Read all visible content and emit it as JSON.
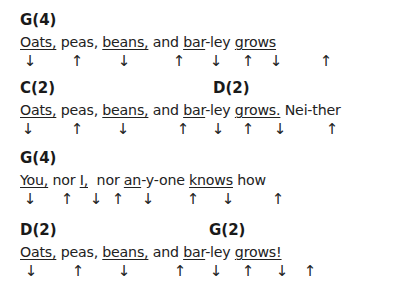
{
  "blocks": [
    {
      "top": 12,
      "chords": [
        {
          "label": "G(4)",
          "x": 20
        }
      ],
      "lyrics": [
        {
          "text": "Oats,",
          "u": true
        },
        {
          "text": " peas, ",
          "u": false
        },
        {
          "text": "beans,",
          "u": true
        },
        {
          "text": " and ",
          "u": false
        },
        {
          "text": "bar",
          "u": true
        },
        {
          "text": "-ley ",
          "u": false
        },
        {
          "text": "grows",
          "u": true
        }
      ],
      "strums": [
        {
          "dir": "down",
          "glyph": "↓",
          "x": 30
        },
        {
          "dir": "up",
          "glyph": "↑",
          "x": 77
        },
        {
          "dir": "down",
          "glyph": "↓",
          "x": 124
        },
        {
          "dir": "up",
          "glyph": "↑",
          "x": 179
        },
        {
          "dir": "down",
          "glyph": "↓",
          "x": 216
        },
        {
          "dir": "up",
          "glyph": "↑",
          "x": 248
        },
        {
          "dir": "down",
          "glyph": "↓",
          "x": 276
        },
        {
          "dir": "up",
          "glyph": "↑",
          "x": 326
        }
      ]
    },
    {
      "top": 80,
      "chords": [
        {
          "label": "C(2)",
          "x": 20
        },
        {
          "label": "D(2)",
          "x": 213
        }
      ],
      "lyrics": [
        {
          "text": "Oats,",
          "u": true
        },
        {
          "text": " peas, ",
          "u": false
        },
        {
          "text": "beans,",
          "u": true
        },
        {
          "text": " and ",
          "u": false
        },
        {
          "text": "bar",
          "u": true
        },
        {
          "text": "-ley ",
          "u": false
        },
        {
          "text": "grows.",
          "u": true
        },
        {
          "text": " Nei-ther",
          "u": false
        }
      ],
      "strums": [
        {
          "dir": "down",
          "glyph": "↓",
          "x": 28
        },
        {
          "dir": "up",
          "glyph": "↑",
          "x": 77
        },
        {
          "dir": "down",
          "glyph": "↓",
          "x": 123
        },
        {
          "dir": "up",
          "glyph": "↑",
          "x": 183
        },
        {
          "dir": "down",
          "glyph": "↓",
          "x": 218
        },
        {
          "dir": "up",
          "glyph": "↑",
          "x": 248
        },
        {
          "dir": "down",
          "glyph": "↓",
          "x": 280
        },
        {
          "dir": "up",
          "glyph": "↑",
          "x": 332
        }
      ]
    },
    {
      "top": 150,
      "chords": [
        {
          "label": "G(4)",
          "x": 20
        }
      ],
      "lyrics": [
        {
          "text": "You,",
          "u": true
        },
        {
          "text": " nor ",
          "u": false
        },
        {
          "text": "I,",
          "u": true
        },
        {
          "text": "  nor ",
          "u": false
        },
        {
          "text": "an",
          "u": true
        },
        {
          "text": "-y-one ",
          "u": false
        },
        {
          "text": "knows",
          "u": true
        },
        {
          "text": " how",
          "u": false
        }
      ],
      "strums": [
        {
          "dir": "down",
          "glyph": "↓",
          "x": 30
        },
        {
          "dir": "up",
          "glyph": "↑",
          "x": 67
        },
        {
          "dir": "down",
          "glyph": "↓",
          "x": 96
        },
        {
          "dir": "up",
          "glyph": "↑",
          "x": 118
        },
        {
          "dir": "down",
          "glyph": "↓",
          "x": 148
        },
        {
          "dir": "up",
          "glyph": "↑",
          "x": 193
        },
        {
          "dir": "down",
          "glyph": "↓",
          "x": 228
        },
        {
          "dir": "up",
          "glyph": "↑",
          "x": 278
        }
      ]
    },
    {
      "top": 222,
      "chords": [
        {
          "label": "D(2)",
          "x": 20
        },
        {
          "label": "G(2)",
          "x": 209
        }
      ],
      "lyrics": [
        {
          "text": "Oats,",
          "u": true
        },
        {
          "text": " peas, ",
          "u": false
        },
        {
          "text": "beans,",
          "u": true
        },
        {
          "text": " and ",
          "u": false
        },
        {
          "text": "bar",
          "u": true
        },
        {
          "text": "-ley ",
          "u": false
        },
        {
          "text": "grows!",
          "u": true
        }
      ],
      "strums": [
        {
          "dir": "down",
          "glyph": "↓",
          "x": 31
        },
        {
          "dir": "up",
          "glyph": "↑",
          "x": 78
        },
        {
          "dir": "down",
          "glyph": "↓",
          "x": 124
        },
        {
          "dir": "up",
          "glyph": "↑",
          "x": 180
        },
        {
          "dir": "down",
          "glyph": "↓",
          "x": 216
        },
        {
          "dir": "up",
          "glyph": "↑",
          "x": 248
        },
        {
          "dir": "down",
          "glyph": "↓",
          "x": 282
        },
        {
          "dir": "up",
          "glyph": "↑",
          "x": 310
        }
      ]
    }
  ]
}
